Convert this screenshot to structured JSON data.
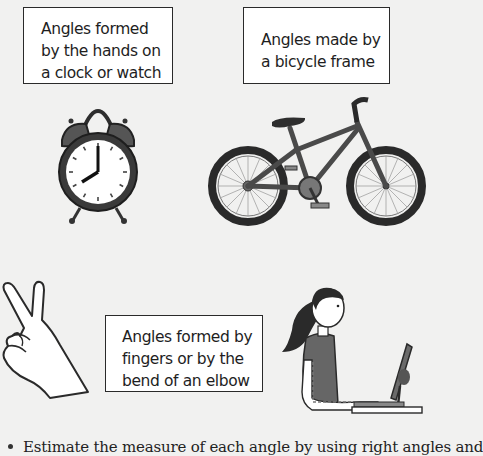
{
  "captions": {
    "clock": {
      "lines": [
        "Angles formed",
        "by the hands on",
        "a clock or watch"
      ]
    },
    "bicycle": {
      "lines": [
        "Angles made by",
        "a bicycle frame"
      ]
    },
    "body": {
      "lines": [
        "Angles formed by",
        "fingers or by the",
        "bend of an elbow"
      ]
    }
  },
  "illustrations": {
    "clock": {
      "icon": "alarm-clock-icon",
      "time_shown": "8:00"
    },
    "bicycle": {
      "icon": "bicycle-icon"
    },
    "hand": {
      "icon": "peace-sign-hand-icon"
    },
    "person": {
      "icon": "person-typing-at-computer-icon"
    }
  },
  "instructions": {
    "bullet_1": "Estimate the measure of each angle by using right angles and"
  },
  "colors": {
    "background": "#f1f1f0",
    "box_border": "#2a2a2a",
    "illustration_dark": "#3a3a3a",
    "illustration_mid": "#6a6a6a"
  }
}
